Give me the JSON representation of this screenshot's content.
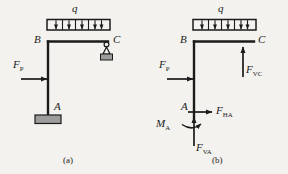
{
  "figure": {
    "background_color": "#f3f2ee",
    "ink_color": "#1b1b1b",
    "support_fill": "#9c9c9c",
    "panels": [
      {
        "caption": "(a)",
        "description": "L-shaped frame: vertical column fixed at base A, horizontal beam BC with uniformly distributed load q, pin-roller support at C, horizontal point load F_P applied on column",
        "labels": {
          "distributed_load": "q",
          "joint_b": "B",
          "joint_c": "C",
          "base_a": "A",
          "point_load": "F",
          "point_load_sub": "P"
        }
      },
      {
        "caption": "(b)",
        "description": "Free-body diagram of the frame showing support reactions at A and C",
        "labels": {
          "distributed_load": "q",
          "joint_b": "B",
          "joint_c": "C",
          "base_a": "A",
          "point_load": "F",
          "point_load_sub": "P",
          "reaction_vc": "F",
          "reaction_vc_sub": "VC",
          "reaction_ha": "F",
          "reaction_ha_sub": "HA",
          "reaction_va": "F",
          "reaction_va_sub": "VA",
          "moment_a": "M",
          "moment_a_sub": "A"
        }
      }
    ]
  }
}
